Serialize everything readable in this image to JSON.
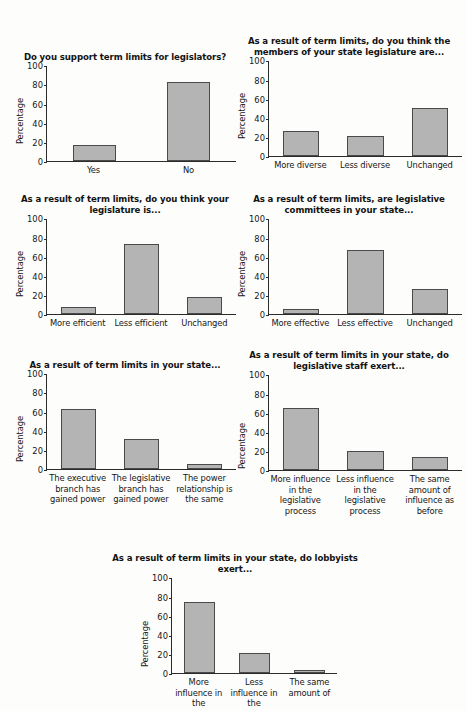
{
  "page": {
    "axis_label": "Percentage",
    "bar_fill": "#b4b4b4",
    "bar_stroke": "#4a4a4a",
    "axis_color": "#2b2b2b",
    "background": "#fdfdfc"
  },
  "chart_data": [
    {
      "id": "support-term-limits",
      "type": "bar",
      "title": "Do you support term limits for legislators?",
      "xlabel": "",
      "ylabel": "Percentage",
      "ylim": [
        0,
        100
      ],
      "yticks": [
        0,
        20,
        40,
        60,
        80,
        100
      ],
      "grid": false,
      "legend": "none",
      "categories": [
        "Yes",
        "No"
      ],
      "values": [
        17,
        83
      ]
    },
    {
      "id": "members-diversity",
      "type": "bar",
      "title": "As a result of term limits, do you think the members of your state legislature are...",
      "xlabel": "",
      "ylabel": "Percentage",
      "ylim": [
        0,
        100
      ],
      "yticks": [
        0,
        20,
        40,
        60,
        80,
        100
      ],
      "grid": false,
      "legend": "none",
      "categories": [
        "More diverse",
        "Less diverse",
        "Unchanged"
      ],
      "values": [
        27,
        22,
        51
      ]
    },
    {
      "id": "legislature-efficiency",
      "type": "bar",
      "title": "As a result of term limits, do you think your legislature is...",
      "xlabel": "",
      "ylabel": "Percentage",
      "ylim": [
        0,
        100
      ],
      "yticks": [
        0,
        20,
        40,
        60,
        80,
        100
      ],
      "grid": false,
      "legend": "none",
      "categories": [
        "More efficient",
        "Less efficient",
        "Unchanged"
      ],
      "values": [
        8,
        74,
        18
      ]
    },
    {
      "id": "committee-effectiveness",
      "type": "bar",
      "title": "As a result of term limits, are legislative committees in your state...",
      "xlabel": "",
      "ylabel": "Percentage",
      "ylim": [
        0,
        100
      ],
      "yticks": [
        0,
        20,
        40,
        60,
        80,
        100
      ],
      "grid": false,
      "legend": "none",
      "categories": [
        "More effective",
        "Less effective",
        "Unchanged"
      ],
      "values": [
        6,
        68,
        27
      ]
    },
    {
      "id": "branch-power",
      "type": "bar",
      "title": "As a result of term limits in your state...",
      "xlabel": "",
      "ylabel": "Percentage",
      "ylim": [
        0,
        100
      ],
      "yticks": [
        0,
        20,
        40,
        60,
        80,
        100
      ],
      "grid": false,
      "legend": "none",
      "categories": [
        "The executive branch has gained power",
        "The legislative branch has gained power",
        "The power relationship is the same"
      ],
      "values": [
        63,
        32,
        5
      ]
    },
    {
      "id": "legislative-staff-influence",
      "type": "bar",
      "title": "As a result of term limits in your state, do legislative staff exert...",
      "xlabel": "",
      "ylabel": "Percentage",
      "ylim": [
        0,
        100
      ],
      "yticks": [
        0,
        20,
        40,
        60,
        80,
        100
      ],
      "grid": false,
      "legend": "none",
      "categories": [
        "More influence in the legislative process",
        "Less influence in the legislative process",
        "The same amount of influence as before"
      ],
      "values": [
        66,
        20,
        14
      ]
    },
    {
      "id": "lobbyist-influence",
      "type": "bar",
      "title": "As a result of term limits in your state, do lobbyists exert...",
      "xlabel": "",
      "ylabel": "Percentage",
      "ylim": [
        0,
        100
      ],
      "yticks": [
        0,
        20,
        40,
        60,
        80,
        100
      ],
      "grid": false,
      "legend": "none",
      "note": "x-axis category labels are cropped at the bottom edge of the page",
      "categories": [
        "More influence in the",
        "Less influence in the",
        "The same amount of"
      ],
      "values": [
        75,
        21,
        4
      ]
    }
  ]
}
